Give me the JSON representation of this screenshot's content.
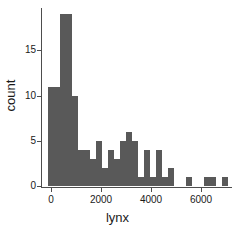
{
  "chart_data": {
    "type": "bar",
    "title": "",
    "subtitle": "",
    "xlabel": "lynx",
    "ylabel": "count",
    "xlim": [
      -350,
      7250
    ],
    "ylim": [
      0,
      19.7
    ],
    "grid": false,
    "legend": null,
    "bin_width": 240,
    "bar_color": "#595959",
    "axis_color": "#4d4d4d",
    "background_color": "#ffffff",
    "xticks": [
      0,
      2000,
      4000,
      6000
    ],
    "xtick_labels": [
      "0",
      "2000",
      "4000",
      "6000"
    ],
    "yticks": [
      0,
      5,
      10,
      15
    ],
    "ytick_labels": [
      "0",
      "5",
      "10",
      "15"
    ],
    "bins": [
      {
        "x0": -120,
        "x1": 120,
        "count": 11
      },
      {
        "x0": 120,
        "x1": 360,
        "count": 11
      },
      {
        "x0": 360,
        "x1": 600,
        "count": 19
      },
      {
        "x0": 600,
        "x1": 840,
        "count": 19
      },
      {
        "x0": 840,
        "x1": 1080,
        "count": 10
      },
      {
        "x0": 1080,
        "x1": 1320,
        "count": 4
      },
      {
        "x0": 1320,
        "x1": 1560,
        "count": 4
      },
      {
        "x0": 1560,
        "x1": 1800,
        "count": 3
      },
      {
        "x0": 1800,
        "x1": 2040,
        "count": 5
      },
      {
        "x0": 2040,
        "x1": 2280,
        "count": 2
      },
      {
        "x0": 2280,
        "x1": 2520,
        "count": 4
      },
      {
        "x0": 2520,
        "x1": 2760,
        "count": 3
      },
      {
        "x0": 2760,
        "x1": 3000,
        "count": 5
      },
      {
        "x0": 3000,
        "x1": 3240,
        "count": 6
      },
      {
        "x0": 3240,
        "x1": 3480,
        "count": 5
      },
      {
        "x0": 3480,
        "x1": 3720,
        "count": 1
      },
      {
        "x0": 3720,
        "x1": 3960,
        "count": 4
      },
      {
        "x0": 3960,
        "x1": 4200,
        "count": 1
      },
      {
        "x0": 4200,
        "x1": 4440,
        "count": 4
      },
      {
        "x0": 4440,
        "x1": 4680,
        "count": 1
      },
      {
        "x0": 4680,
        "x1": 4920,
        "count": 2
      },
      {
        "x0": 5400,
        "x1": 5640,
        "count": 1
      },
      {
        "x0": 6120,
        "x1": 6360,
        "count": 1
      },
      {
        "x0": 6360,
        "x1": 6600,
        "count": 1
      },
      {
        "x0": 6840,
        "x1": 7080,
        "count": 1
      }
    ]
  }
}
